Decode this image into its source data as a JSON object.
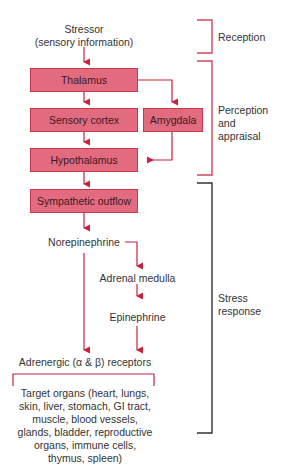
{
  "diagram": {
    "nodes": {
      "stressor": [
        "Stressor",
        "(sensory information)"
      ],
      "thalamus": "Thalamus",
      "sensory_cortex": "Sensory cortex",
      "amygdala": "Amygdala",
      "hypothalamus": "Hypothalamus",
      "sympathetic_outflow": "Sympathetic outflow",
      "norepinephrine": "Norepinephrine",
      "adrenal_medulla": "Adrenal medulla",
      "epinephrine": "Epinephrine",
      "receptors": "Adrenergic (α & β) receptors",
      "target_organs": [
        "Target organs (heart, lungs,",
        "skin, liver, stomach, GI tract,",
        "muscle, blood vessels,",
        "glands, bladder, reproductive",
        "organs, immune cells,",
        "thymus, spleen)"
      ]
    },
    "stages": {
      "reception": "Reception",
      "perception": [
        "Perception",
        "and",
        "appraisal"
      ],
      "stress": [
        "Stress",
        "response"
      ]
    },
    "colors": {
      "box_fill": "#e36b7f",
      "box_border": "#c8364f",
      "arrow": "#c8223f",
      "bracket_red": "#d0455e",
      "bracket_dark": "#333333"
    }
  }
}
